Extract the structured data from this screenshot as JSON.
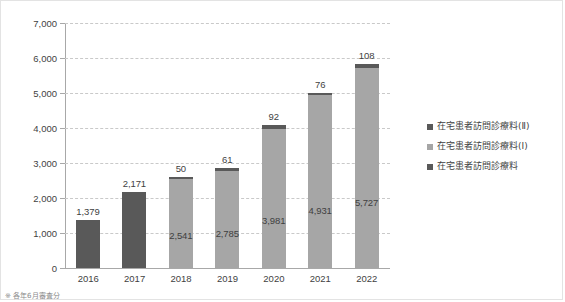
{
  "chart_data": {
    "type": "bar",
    "subtype": "stacked-column",
    "title": "",
    "xlabel": "",
    "ylabel": "",
    "ylim": [
      0,
      7000
    ],
    "ystep": 1000,
    "grid": true,
    "legend_position": "right",
    "categories": [
      "2016",
      "2017",
      "2018",
      "2019",
      "2020",
      "2021",
      "2022"
    ],
    "ytick_labels": [
      "0",
      "1,000",
      "2,000",
      "3,000",
      "4,000",
      "5,000",
      "6,000",
      "7,000"
    ],
    "ytick_values": [
      0,
      1000,
      2000,
      3000,
      4000,
      5000,
      6000,
      7000
    ],
    "series": [
      {
        "name": "在宅患者訪問診療料",
        "color": "#595959",
        "values": [
          1379,
          2171,
          null,
          null,
          null,
          null,
          null
        ],
        "labels": [
          "1,379",
          "2,171",
          "",
          "",
          "",
          "",
          ""
        ]
      },
      {
        "name": "在宅患者訪問診療料(I)",
        "color": "#a6a6a6",
        "values": [
          null,
          null,
          2541,
          2785,
          3981,
          4931,
          5727
        ],
        "labels": [
          "",
          "",
          "2,541",
          "2,785",
          "3,981",
          "4,931",
          "5,727"
        ]
      },
      {
        "name": "在宅患者訪問診療料(II)",
        "color": "#595959",
        "values": [
          null,
          null,
          50,
          61,
          92,
          76,
          108
        ],
        "labels": [
          "",
          "",
          "50",
          "61",
          "92",
          "76",
          "108"
        ]
      }
    ]
  },
  "legend": {
    "items": [
      {
        "label": "在宅患者訪問診療料(Ⅱ)",
        "color": "#595959"
      },
      {
        "label": "在宅患者訪問診療料(Ⅰ)",
        "color": "#a6a6a6"
      },
      {
        "label": "在宅患者訪問診療料",
        "color": "#595959"
      }
    ]
  },
  "footnote": {
    "text": "※ 各年6月審査分"
  },
  "axis": {
    "line_color": "#a8a8a8",
    "grid_color": "#c9c9c9"
  }
}
